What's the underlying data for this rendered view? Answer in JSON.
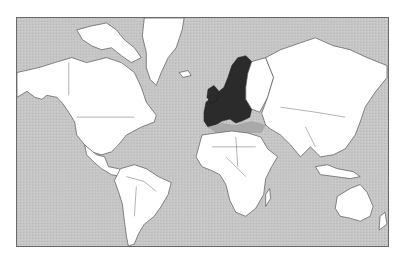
{
  "map": {
    "title": "",
    "projection": "Mercator",
    "highlight_label": "European Union member states",
    "colors": {
      "ocean": "#c6c6c6",
      "land": "#ffffff",
      "highlight": "#2b2b2b",
      "border": "#555555",
      "frame": "#6a6a6a"
    },
    "frame": {
      "x": 16,
      "y": 17,
      "width": 373,
      "height": 230
    },
    "regions": [
      {
        "name": "north-america",
        "highlighted": false,
        "d": "M0 55 L22 50 L38 45 L55 40 L70 45 L90 40 L105 45 L118 55 L125 70 L130 85 L140 98 L138 105 L125 110 L110 118 L102 128 L95 135 L85 138 L75 135 L68 128 L60 118 L58 105 L52 95 L45 85 L40 80 L30 78 L25 82 L18 80 L10 74 L0 80 Z"
      },
      {
        "name": "canadian-arctic-islands",
        "highlighted": false,
        "d": "M60 12 L75 8 L90 5 L100 12 L108 22 L118 30 L125 40 L115 45 L105 38 L95 30 L85 32 L75 28 L66 22 Z"
      },
      {
        "name": "greenland",
        "highlighted": false,
        "d": "M128 0 L168 0 L166 12 L160 30 L152 40 L145 55 L140 68 L134 62 L130 50 L130 35 L126 18 Z"
      },
      {
        "name": "central-america",
        "highlighted": false,
        "d": "M68 128 L80 138 L88 140 L92 150 L102 152 L108 155 L105 160 L95 158 L85 152 L78 146 L70 138 Z"
      },
      {
        "name": "south-america",
        "highlighted": false,
        "d": "M104 152 L118 148 L130 152 L142 160 L155 166 L152 178 L145 190 L138 200 L128 208 L122 218 L118 228 L112 230 L110 220 L108 205 L106 188 L102 175 L98 164 Z"
      },
      {
        "name": "iceland",
        "highlighted": false,
        "d": "M163 55 L172 53 L175 58 L167 60 Z"
      },
      {
        "name": "eu",
        "highlighted": true,
        "d": "M188 95 L190 85 L196 80 L200 82 L202 75 L208 70 L212 60 L216 48 L222 40 L230 38 L236 44 L232 56 L230 70 L230 82 L236 92 L234 100 L226 104 L220 106 L214 102 L206 104 L200 108 L192 110 L188 104 Z"
      },
      {
        "name": "uk-ireland",
        "highlighted": true,
        "d": "M192 72 L198 68 L203 74 L201 84 L195 86 L191 80 Z"
      },
      {
        "name": "mediterranean",
        "highlighted": false,
        "d": "M192 110 L206 106 L220 108 L236 104 L250 108 L246 116 L232 116 L216 114 L200 116 Z"
      },
      {
        "name": "eastern-europe",
        "highlighted": false,
        "d": "M236 44 L250 40 L258 60 L252 80 L244 95 L236 92 L230 82 L230 70 L232 56 Z"
      },
      {
        "name": "russia-asia",
        "highlighted": false,
        "d": "M250 40 L265 32 L285 25 L300 20 L318 28 L335 32 L352 40 L372 48 L372 60 L360 75 L350 90 L345 105 L340 118 L330 132 L318 138 L305 140 L295 130 L285 140 L275 128 L265 118 L255 112 L250 108 L246 96 L252 80 L258 60 Z"
      },
      {
        "name": "africa",
        "highlighted": false,
        "d": "M186 118 L200 116 L216 114 L232 116 L245 120 L252 132 L262 140 L256 150 L250 162 L248 178 L240 192 L230 200 L220 196 L214 184 L210 168 L204 158 L196 154 L186 150 L180 140 Z"
      },
      {
        "name": "madagascar",
        "highlighted": false,
        "d": "M250 178 L254 172 L255 182 L250 190 Z"
      },
      {
        "name": "southeast-asia-islands",
        "highlighted": false,
        "d": "M300 150 L312 148 L322 152 L338 155 L345 160 L335 162 L320 160 L305 158 Z"
      },
      {
        "name": "australia",
        "highlighted": false,
        "d": "M322 180 L335 172 L345 168 L352 176 L358 190 L355 200 L345 205 L335 202 L325 200 L320 192 Z"
      },
      {
        "name": "new-zealand",
        "highlighted": false,
        "d": "M365 200 L370 196 L372 208 L364 214 Z"
      }
    ],
    "borders": [
      "M52 45 L52 78",
      "M60 100 L118 100",
      "M110 160 L128 165 L140 175",
      "M120 170 L118 200",
      "M196 130 L240 130",
      "M210 140 L230 160",
      "M220 120 L222 150",
      "M265 90 L300 95 L330 100",
      "M290 110 L300 130"
    ]
  }
}
